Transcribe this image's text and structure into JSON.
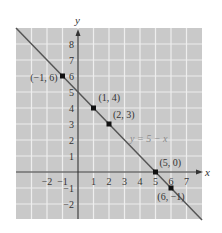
{
  "chart_data": {
    "type": "line",
    "title": "",
    "xlabel": "x",
    "ylabel": "y",
    "xlim": [
      -4,
      8
    ],
    "ylim": [
      -3,
      9
    ],
    "grid": true,
    "x_ticks": [
      -2,
      -1,
      1,
      2,
      3,
      4,
      5,
      6,
      7
    ],
    "x_tick_labels": [
      "−2",
      "−1",
      "1",
      "2",
      "3",
      "4",
      "5",
      "6",
      "7"
    ],
    "y_ticks": [
      8,
      7,
      6,
      5,
      4,
      3,
      2,
      1,
      -1,
      -2
    ],
    "y_tick_labels": [
      "8",
      "7",
      "6",
      "5",
      "4",
      "3",
      "2",
      "1",
      "−1",
      "−2"
    ],
    "series": [
      {
        "name": "y = 5 − x",
        "equation": "y = 5 - x",
        "line_endpoints": [
          [
            -4,
            9
          ],
          [
            8,
            -3
          ]
        ]
      }
    ],
    "points": [
      {
        "x": -1,
        "y": 6,
        "label": "(−1, 6)"
      },
      {
        "x": 1,
        "y": 4,
        "label": "(1, 4)"
      },
      {
        "x": 2,
        "y": 3,
        "label": "(2, 3)"
      },
      {
        "x": 5,
        "y": 0,
        "label": "(5, 0)"
      },
      {
        "x": 6,
        "y": -1,
        "label": "(6, −1)"
      }
    ],
    "annotations": [
      {
        "text": "y = 5 − x",
        "near": [
          3.5,
          2.2
        ]
      }
    ]
  },
  "colors": {
    "grid_background": "#c9c9c9",
    "grid_lines": "#eeeeee",
    "axis": "#333333",
    "line": "#555555",
    "point": "#111111",
    "equation_label": "#8a8a8a"
  }
}
